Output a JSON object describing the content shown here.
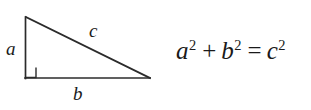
{
  "figure": {
    "background_color": "#ffffff",
    "ink_color": "#1a1a1a",
    "width": 311,
    "height": 110
  },
  "diagram": {
    "name": "right-triangle",
    "stroke_color": "#2b2b2b",
    "stroke_width": 1.6,
    "vertices": {
      "apex": [
        26,
        17
      ],
      "bottom_left": [
        25,
        78
      ],
      "bottom_right": [
        150,
        78
      ]
    },
    "right_angle_marker": {
      "corner": [
        25,
        78
      ],
      "size": 11
    },
    "labels": {
      "leg_vertical": "a",
      "hypotenuse": "c",
      "leg_horizontal": "b"
    }
  },
  "equation": {
    "full_text": "a² + b² = c²",
    "terms": {
      "a_base": "a",
      "a_exponent": "2",
      "plus": "+",
      "b_base": "b",
      "b_exponent": "2",
      "equals": "=",
      "c_base": "c",
      "c_exponent": "2"
    }
  }
}
